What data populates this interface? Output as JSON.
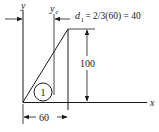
{
  "diagram": {
    "axes": {
      "x_label": "x",
      "y_label": "y",
      "yc_label_main": "y",
      "yc_label_sub": "c"
    },
    "shape": {
      "type": "right triangle",
      "region_number": "1",
      "height_label": "100",
      "base_label": "60"
    },
    "annotation": {
      "d_main": "d",
      "d_sub": "1",
      "d_expr": " = 2/3(60) = 40"
    },
    "colors": {
      "ink": "#1a1a1a",
      "background": "#ffffff"
    }
  }
}
